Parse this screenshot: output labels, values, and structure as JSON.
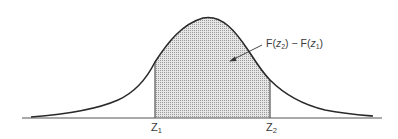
{
  "diagram": {
    "title": "",
    "type": "normal-distribution-area",
    "annotation": {
      "text_parts": [
        "F(",
        "z",
        "2",
        ") − F(",
        "z",
        "1",
        ")"
      ],
      "full_text": "F(z2) − F(z1)"
    },
    "x_labels": [
      {
        "base": "Z",
        "sub": "1",
        "name": "z1"
      },
      {
        "base": "Z",
        "sub": "2",
        "name": "z2"
      }
    ],
    "colors": {
      "curve": "#2a2a2a",
      "shade": "#cfcfcf",
      "axis": "#555555",
      "text": "#3a3a3a"
    }
  }
}
